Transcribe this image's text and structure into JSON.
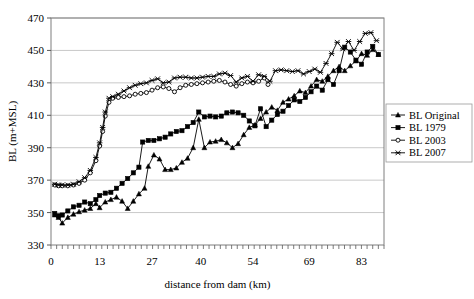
{
  "chart_data": {
    "type": "line",
    "title": "",
    "xlabel": "distance from dam (km)",
    "ylabel": "BL (m+MSL)",
    "xlim": [
      0,
      89
    ],
    "ylim": [
      330,
      470
    ],
    "xticks": [
      0,
      13,
      27,
      40,
      54,
      69,
      83
    ],
    "yticks": [
      330,
      350,
      370,
      390,
      410,
      430,
      450,
      470
    ],
    "grid": "horizontal",
    "legend_position": "right",
    "series": [
      {
        "name": "BL Original",
        "marker": "triangle",
        "color": "#000000",
        "points": [
          [
            1.0,
            348.5
          ],
          [
            2.0,
            347.0
          ],
          [
            3.0,
            343.5
          ],
          [
            4.5,
            347.0
          ],
          [
            6.0,
            349.0
          ],
          [
            7.5,
            350.5
          ],
          [
            9.0,
            351.5
          ],
          [
            10.5,
            352.5
          ],
          [
            12.0,
            355.5
          ],
          [
            13.0,
            353.0
          ],
          [
            14.5,
            356.5
          ],
          [
            16.0,
            358.0
          ],
          [
            17.5,
            359.5
          ],
          [
            19.0,
            357.0
          ],
          [
            20.5,
            352.5
          ],
          [
            22.0,
            357.0
          ],
          [
            23.5,
            361.5
          ],
          [
            25.0,
            365.0
          ],
          [
            26.0,
            378.5
          ],
          [
            27.5,
            385.5
          ],
          [
            29.0,
            383.0
          ],
          [
            30.5,
            376.5
          ],
          [
            32.0,
            376.5
          ],
          [
            33.5,
            377.5
          ],
          [
            35.0,
            381.0
          ],
          [
            36.5,
            383.5
          ],
          [
            38.0,
            390.0
          ],
          [
            39.5,
            407.5
          ],
          [
            41.0,
            390.0
          ],
          [
            42.5,
            393.5
          ],
          [
            44.0,
            394.0
          ],
          [
            45.5,
            395.0
          ],
          [
            47.0,
            393.0
          ],
          [
            48.5,
            390.0
          ],
          [
            50.0,
            392.5
          ],
          [
            51.5,
            398.0
          ],
          [
            53.0,
            402.5
          ],
          [
            54.5,
            404.0
          ],
          [
            56.0,
            408.0
          ],
          [
            57.5,
            412.0
          ],
          [
            59.0,
            415.0
          ],
          [
            60.5,
            413.0
          ],
          [
            62.0,
            418.0
          ],
          [
            63.5,
            420.0
          ],
          [
            65.0,
            422.0
          ],
          [
            66.5,
            425.0
          ],
          [
            68.0,
            424.0
          ],
          [
            69.5,
            428.0
          ],
          [
            71.0,
            432.0
          ],
          [
            72.5,
            431.0
          ],
          [
            74.0,
            434.0
          ],
          [
            75.5,
            437.5
          ],
          [
            77.0,
            440.0
          ],
          [
            78.5,
            437.5
          ],
          [
            80.0,
            440.5
          ],
          [
            81.5,
            443.5
          ],
          [
            83.0,
            448.0
          ],
          [
            84.5,
            447.0
          ],
          [
            86.0,
            450.5
          ],
          [
            87.5,
            447.5
          ]
        ]
      },
      {
        "name": "BL 1979",
        "marker": "square",
        "color": "#000000",
        "points": [
          [
            1.0,
            349.5
          ],
          [
            2.0,
            348.0
          ],
          [
            3.0,
            348.5
          ],
          [
            4.5,
            351.0
          ],
          [
            6.0,
            353.5
          ],
          [
            7.5,
            354.5
          ],
          [
            9.0,
            356.5
          ],
          [
            10.5,
            355.5
          ],
          [
            12.0,
            358.0
          ],
          [
            13.0,
            360.5
          ],
          [
            14.5,
            362.0
          ],
          [
            16.0,
            362.5
          ],
          [
            17.5,
            365.0
          ],
          [
            19.0,
            368.0
          ],
          [
            20.5,
            371.0
          ],
          [
            22.0,
            374.5
          ],
          [
            23.5,
            378.0
          ],
          [
            24.5,
            393.5
          ],
          [
            26.0,
            394.5
          ],
          [
            27.5,
            394.5
          ],
          [
            29.0,
            395.5
          ],
          [
            30.5,
            396.5
          ],
          [
            32.0,
            398.5
          ],
          [
            33.5,
            400.0
          ],
          [
            35.0,
            400.5
          ],
          [
            36.5,
            403.0
          ],
          [
            38.0,
            405.5
          ],
          [
            39.5,
            412.0
          ],
          [
            41.0,
            409.0
          ],
          [
            42.5,
            409.5
          ],
          [
            44.0,
            409.0
          ],
          [
            45.5,
            409.5
          ],
          [
            47.0,
            411.5
          ],
          [
            48.5,
            412.0
          ],
          [
            50.0,
            411.5
          ],
          [
            51.5,
            410.0
          ],
          [
            53.0,
            406.5
          ],
          [
            54.5,
            403.5
          ],
          [
            56.0,
            414.0
          ],
          [
            57.5,
            403.0
          ],
          [
            59.0,
            407.0
          ],
          [
            60.5,
            410.5
          ],
          [
            62.0,
            412.5
          ],
          [
            63.5,
            416.0
          ],
          [
            65.0,
            419.5
          ],
          [
            66.5,
            418.5
          ],
          [
            68.0,
            421.0
          ],
          [
            69.5,
            424.5
          ],
          [
            71.0,
            428.0
          ],
          [
            72.5,
            425.5
          ],
          [
            74.0,
            432.0
          ],
          [
            75.5,
            429.0
          ],
          [
            77.0,
            437.5
          ],
          [
            78.5,
            452.0
          ],
          [
            80.0,
            449.0
          ],
          [
            81.5,
            444.0
          ],
          [
            83.0,
            441.5
          ],
          [
            84.5,
            449.0
          ],
          [
            86.0,
            452.5
          ],
          [
            87.5,
            447.5
          ]
        ]
      },
      {
        "name": "BL 2003",
        "marker": "circle",
        "color": "#000000",
        "points": [
          [
            1.0,
            367.0
          ],
          [
            2.0,
            366.5
          ],
          [
            3.0,
            366.5
          ],
          [
            4.5,
            366.5
          ],
          [
            6.0,
            367.0
          ],
          [
            7.5,
            368.0
          ],
          [
            9.0,
            370.0
          ],
          [
            10.5,
            374.5
          ],
          [
            12.0,
            382.0
          ],
          [
            13.0,
            391.0
          ],
          [
            13.8,
            400.0
          ],
          [
            14.5,
            409.5
          ],
          [
            15.5,
            418.0
          ],
          [
            16.5,
            420.5
          ],
          [
            18.0,
            421.0
          ],
          [
            19.5,
            421.5
          ],
          [
            21.0,
            422.0
          ],
          [
            22.5,
            423.0
          ],
          [
            24.0,
            423.5
          ],
          [
            25.5,
            424.0
          ],
          [
            27.0,
            425.5
          ],
          [
            28.5,
            427.0
          ],
          [
            30.0,
            427.5
          ],
          [
            31.5,
            426.5
          ],
          [
            33.0,
            424.5
          ],
          [
            34.5,
            427.0
          ],
          [
            36.0,
            428.5
          ],
          [
            37.5,
            429.0
          ],
          [
            39.0,
            429.5
          ],
          [
            40.5,
            430.0
          ],
          [
            42.0,
            430.5
          ],
          [
            43.5,
            431.0
          ],
          [
            45.0,
            431.5
          ],
          [
            46.5,
            430.5
          ],
          [
            48.0,
            429.0
          ],
          [
            49.5,
            428.0
          ],
          [
            51.0,
            429.5
          ],
          [
            52.5,
            430.5
          ],
          [
            54.0,
            430.0
          ],
          [
            55.5,
            431.0
          ],
          [
            57.0,
            433.0
          ],
          [
            58.0,
            429.0
          ]
        ]
      },
      {
        "name": "BL 2007",
        "marker": "star",
        "color": "#000000",
        "points": [
          [
            1.0,
            367.5
          ],
          [
            2.0,
            367.0
          ],
          [
            3.0,
            367.0
          ],
          [
            4.5,
            367.0
          ],
          [
            6.0,
            367.5
          ],
          [
            7.5,
            369.0
          ],
          [
            9.0,
            371.5
          ],
          [
            10.5,
            376.0
          ],
          [
            12.0,
            384.0
          ],
          [
            13.0,
            393.0
          ],
          [
            13.8,
            402.5
          ],
          [
            14.5,
            412.0
          ],
          [
            15.5,
            420.5
          ],
          [
            16.5,
            421.5
          ],
          [
            18.0,
            423.0
          ],
          [
            19.5,
            425.0
          ],
          [
            21.0,
            427.0
          ],
          [
            22.5,
            428.5
          ],
          [
            24.0,
            429.5
          ],
          [
            25.5,
            430.0
          ],
          [
            27.0,
            431.5
          ],
          [
            28.5,
            432.5
          ],
          [
            30.0,
            430.0
          ],
          [
            31.5,
            430.5
          ],
          [
            33.0,
            433.0
          ],
          [
            34.5,
            433.5
          ],
          [
            36.0,
            433.5
          ],
          [
            37.5,
            433.0
          ],
          [
            39.0,
            433.0
          ],
          [
            40.5,
            433.5
          ],
          [
            42.0,
            434.0
          ],
          [
            43.5,
            434.0
          ],
          [
            45.0,
            435.5
          ],
          [
            46.5,
            436.0
          ],
          [
            48.0,
            434.5
          ],
          [
            49.5,
            430.5
          ],
          [
            51.0,
            433.0
          ],
          [
            52.5,
            434.0
          ],
          [
            54.0,
            431.0
          ],
          [
            55.5,
            435.0
          ],
          [
            57.0,
            434.0
          ],
          [
            58.5,
            431.0
          ],
          [
            60.0,
            437.5
          ],
          [
            61.5,
            438.0
          ],
          [
            63.0,
            437.5
          ],
          [
            64.5,
            437.0
          ],
          [
            66.0,
            437.5
          ],
          [
            67.5,
            435.5
          ],
          [
            69.0,
            437.0
          ],
          [
            70.5,
            438.5
          ],
          [
            72.0,
            436.5
          ],
          [
            73.5,
            442.0
          ],
          [
            75.0,
            448.0
          ],
          [
            76.5,
            455.0
          ],
          [
            78.0,
            451.0
          ],
          [
            79.5,
            455.5
          ],
          [
            81.0,
            450.0
          ],
          [
            82.5,
            455.5
          ],
          [
            84.0,
            460.5
          ],
          [
            85.5,
            461.0
          ],
          [
            87.0,
            456.0
          ]
        ]
      }
    ]
  },
  "legend": {
    "items": [
      {
        "label": "BL Original"
      },
      {
        "label": "BL 1979"
      },
      {
        "label": "BL 2003"
      },
      {
        "label": "BL 2007"
      }
    ]
  },
  "axes": {
    "y_title": "BL (m+MSL)",
    "x_title": "distance from dam (km)",
    "y_tick_labels": [
      "470",
      "450",
      "430",
      "410",
      "390",
      "370",
      "350",
      "330"
    ],
    "x_tick_labels": [
      "0",
      "13",
      "27",
      "40",
      "54",
      "69",
      "83"
    ]
  }
}
